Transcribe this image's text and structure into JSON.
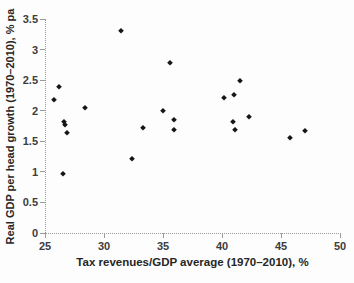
{
  "chart_data": {
    "type": "scatter",
    "xlabel": "Tax revenues/GDP average (1970–2010), %",
    "ylabel": "Real GDP per head growth (1970–2010), % pa",
    "xlim": [
      25,
      50
    ],
    "ylim": [
      0,
      3.5
    ],
    "x_ticks": [
      25,
      30,
      35,
      40,
      45,
      50
    ],
    "x_tick_labels": [
      "25",
      "30",
      "35",
      "40",
      "45",
      "50"
    ],
    "y_ticks": [
      0,
      0.5,
      1,
      1.5,
      2,
      2.5,
      3,
      3.5
    ],
    "y_tick_labels": [
      "0",
      "0.5",
      "1",
      "1.5",
      "2",
      "2.5",
      "3",
      "3.5"
    ],
    "grid": false,
    "legend": false,
    "marker": "diamond",
    "colors": {
      "marker": "#161616",
      "axis": "#9b9b9b",
      "tick_label": "#3c3c3c",
      "axis_label": "#262626",
      "background": "#fdfdfd"
    },
    "points": [
      {
        "x": 25.8,
        "y": 2.18
      },
      {
        "x": 26.2,
        "y": 2.38
      },
      {
        "x": 26.5,
        "y": 0.97
      },
      {
        "x": 26.6,
        "y": 1.82
      },
      {
        "x": 26.7,
        "y": 1.77
      },
      {
        "x": 26.9,
        "y": 1.64
      },
      {
        "x": 28.4,
        "y": 2.05
      },
      {
        "x": 31.4,
        "y": 3.3
      },
      {
        "x": 32.4,
        "y": 1.21
      },
      {
        "x": 33.3,
        "y": 1.72
      },
      {
        "x": 35.0,
        "y": 2.0
      },
      {
        "x": 35.6,
        "y": 2.78
      },
      {
        "x": 35.9,
        "y": 1.85
      },
      {
        "x": 35.9,
        "y": 1.68
      },
      {
        "x": 40.2,
        "y": 2.2
      },
      {
        "x": 40.9,
        "y": 1.82
      },
      {
        "x": 41.0,
        "y": 2.26
      },
      {
        "x": 41.1,
        "y": 1.68
      },
      {
        "x": 41.5,
        "y": 2.48
      },
      {
        "x": 42.3,
        "y": 1.9
      },
      {
        "x": 45.8,
        "y": 1.55
      },
      {
        "x": 47.0,
        "y": 1.67
      }
    ]
  }
}
